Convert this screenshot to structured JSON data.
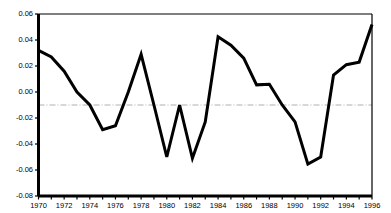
{
  "chart_data": {
    "type": "line",
    "title": "",
    "subtitle": "",
    "xlabel": "",
    "ylabel": "",
    "xlim": [
      1970,
      1996
    ],
    "ylim": [
      -0.08,
      0.06
    ],
    "grid": false,
    "legend": null,
    "legend_position": "none",
    "x": [
      1970,
      1971,
      1972,
      1973,
      1974,
      1975,
      1976,
      1977,
      1978,
      1979,
      1980,
      1981,
      1982,
      1983,
      1984,
      1985,
      1986,
      1987,
      1988,
      1989,
      1990,
      1991,
      1992,
      1993,
      1994,
      1995,
      1996
    ],
    "series": [
      {
        "name": "series-1",
        "color": "#000000",
        "values": [
          0.032,
          0.027,
          0.016,
          0.0,
          -0.01,
          -0.029,
          -0.026,
          0.0,
          0.029,
          -0.01,
          -0.05,
          -0.01,
          -0.051,
          -0.023,
          0.0425,
          0.036,
          0.026,
          0.0055,
          0.006,
          -0.01,
          -0.023,
          -0.0555,
          -0.05,
          0.013,
          0.021,
          0.023,
          0.052
        ]
      }
    ],
    "reference_line": {
      "name": "mean-reference-line",
      "value": -0.01,
      "style": "dash-dot",
      "color": "#b0b0b0"
    },
    "yticks": [
      {
        "value": 0.06,
        "label": "0.06"
      },
      {
        "value": 0.04,
        "label": "0.04"
      },
      {
        "value": 0.02,
        "label": "0.02"
      },
      {
        "value": 0.0,
        "label": "0.00"
      },
      {
        "value": -0.02,
        "label": "-0.02"
      },
      {
        "value": -0.04,
        "label": "-0.04"
      },
      {
        "value": -0.06,
        "label": "-0.06"
      },
      {
        "value": -0.08,
        "label": "-0.08"
      }
    ],
    "xticks": [
      {
        "value": 1970,
        "label": "1970"
      },
      {
        "value": 1971,
        "label": ""
      },
      {
        "value": 1972,
        "label": "1972"
      },
      {
        "value": 1973,
        "label": ""
      },
      {
        "value": 1974,
        "label": "1974"
      },
      {
        "value": 1975,
        "label": ""
      },
      {
        "value": 1976,
        "label": "1976"
      },
      {
        "value": 1977,
        "label": ""
      },
      {
        "value": 1978,
        "label": "1978"
      },
      {
        "value": 1979,
        "label": ""
      },
      {
        "value": 1980,
        "label": "1980"
      },
      {
        "value": 1981,
        "label": ""
      },
      {
        "value": 1982,
        "label": "1982"
      },
      {
        "value": 1983,
        "label": ""
      },
      {
        "value": 1984,
        "label": "1984"
      },
      {
        "value": 1985,
        "label": ""
      },
      {
        "value": 1986,
        "label": "1986"
      },
      {
        "value": 1987,
        "label": ""
      },
      {
        "value": 1988,
        "label": "1988"
      },
      {
        "value": 1989,
        "label": ""
      },
      {
        "value": 1990,
        "label": "1990"
      },
      {
        "value": 1991,
        "label": ""
      },
      {
        "value": 1992,
        "label": "1992"
      },
      {
        "value": 1993,
        "label": ""
      },
      {
        "value": 1994,
        "label": "1994"
      },
      {
        "value": 1995,
        "label": ""
      },
      {
        "value": 1996,
        "label": "1996"
      }
    ]
  },
  "axes": {
    "frame_color": "#000000",
    "line_width": 3.0
  }
}
